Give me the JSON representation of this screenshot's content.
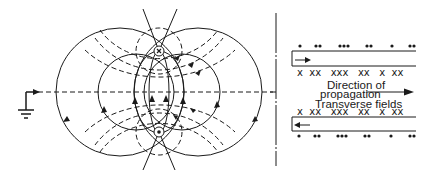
{
  "figure": {
    "type": "two-wire transmission line field diagram",
    "left_panel": {
      "description": "Cross-section of two-wire line showing electric (solid) and magnetic (dashed) field lines",
      "conductors": [
        {
          "name": "upper-conductor",
          "symbol": "x",
          "meaning": "current into page"
        },
        {
          "name": "lower-conductor",
          "symbol": "•",
          "meaning": "current out of page"
        }
      ],
      "ground_symbol": "ground-icon"
    },
    "right_panel": {
      "top_strip": {
        "dots_above": [
          "•",
          "••",
          "•••",
          "••",
          "•",
          "••"
        ],
        "crosses_below": [
          "x",
          "xx",
          "xxx",
          "xx",
          "x",
          "xx"
        ],
        "arrow": "right"
      },
      "labels": {
        "direction_line1": "Direction of",
        "direction_line2": "propagation",
        "transverse": "Transverse fields"
      },
      "bottom_strip": {
        "crosses_above": [
          "x",
          "xx",
          "xxx",
          "xx",
          "x",
          "xx"
        ],
        "dots_below": [
          "•",
          "••",
          "•••",
          "••",
          "•",
          "••"
        ],
        "arrow": "left"
      }
    },
    "colors": {
      "ink": "#1a1a1a",
      "background": "#ffffff"
    }
  },
  "text": {
    "top_cross_row": "x  xx   xxx   xx   x  xx",
    "bottom_cross_row": "x  xx   xxx   xx   x  xx",
    "direction_of": "Direction of",
    "propagation": "propagation",
    "transverse_fields": "Transverse fields",
    "upper_conductor_mark": "x"
  }
}
